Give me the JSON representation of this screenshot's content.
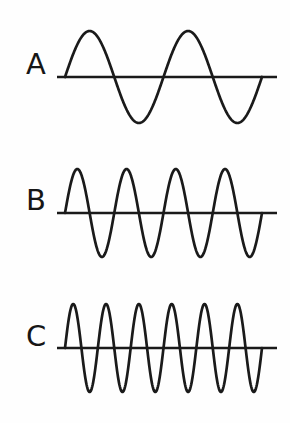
{
  "figure": {
    "background_color": "#fefefe",
    "stroke_color": "#1a1a1a",
    "style": "hand-drawn line art"
  },
  "chart_data": {
    "type": "line",
    "title": "",
    "subtitle": "",
    "xlabel": "",
    "ylabel": "",
    "grid": false,
    "legend_position": "none",
    "xlim": [
      0,
      1
    ],
    "ylim": [
      -1,
      1
    ],
    "series": [
      {
        "name": "A",
        "label": "A",
        "cycles": 2,
        "amplitude": 1,
        "frequency_relative": 1,
        "peaks": 2,
        "troughs": 2,
        "phase": "sine starting at zero rising"
      },
      {
        "name": "B",
        "label": "B",
        "cycles": 4,
        "amplitude": 1,
        "frequency_relative": 2,
        "peaks": 4,
        "troughs": 4,
        "phase": "sine starting at zero rising"
      },
      {
        "name": "C",
        "label": "C",
        "cycles": 6,
        "amplitude": 1,
        "frequency_relative": 3,
        "peaks": 6,
        "troughs": 6,
        "phase": "sine starting at zero rising"
      }
    ]
  },
  "waves": [
    {
      "id": "wave-a",
      "label": "A",
      "label_x": 26,
      "label_y": 50,
      "cycles": 2,
      "baseline_y": 77,
      "amplitude": 46,
      "wave_start_x": 65,
      "wave_end_x": 262,
      "axis_start_x": 57,
      "axis_end_x": 277,
      "row_top": 0
    },
    {
      "id": "wave-b",
      "label": "B",
      "label_x": 26,
      "label_y": 186,
      "cycles": 4,
      "baseline_y": 213,
      "amplitude": 44,
      "wave_start_x": 65,
      "wave_end_x": 262,
      "axis_start_x": 57,
      "axis_end_x": 277,
      "row_top": 141
    },
    {
      "id": "wave-c",
      "label": "C",
      "label_x": 26,
      "label_y": 322,
      "cycles": 6,
      "baseline_y": 348,
      "amplitude": 44,
      "wave_start_x": 65,
      "wave_end_x": 262,
      "axis_start_x": 57,
      "axis_end_x": 277,
      "row_top": 282
    }
  ]
}
